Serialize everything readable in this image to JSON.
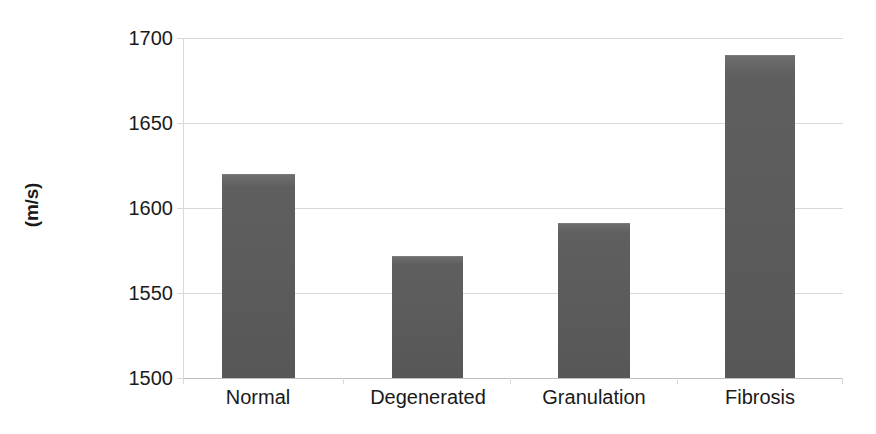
{
  "chart_data": {
    "type": "bar",
    "title": "",
    "subtitle": "",
    "xlabel": "",
    "ylabel": "(m/s)",
    "categories": [
      "Normal",
      "Degenerated",
      "Granulation",
      "Fibrosis"
    ],
    "values": [
      1620,
      1572,
      1591,
      1690
    ],
    "ylim": [
      1500,
      1700
    ],
    "ytick_labels": [
      "1700",
      "1650",
      "1600",
      "1550",
      "1500"
    ],
    "ytick_values": [
      1700,
      1650,
      1600,
      1550,
      1500
    ],
    "grid": true,
    "legend": null,
    "legend_position": "none",
    "series": [
      {
        "name": "Sound speed",
        "values": [
          1620,
          1572,
          1591,
          1690
        ],
        "color": "#5b5b5b"
      }
    ],
    "colors": {
      "bar_fill": "#5b5b5b",
      "gridline": "#d9d9d9",
      "axis_line": "#bfbfbf",
      "text": "#1a1a1a",
      "background": "#ffffff"
    }
  },
  "axis": {
    "y_title": "(m/s)",
    "ticks": [
      {
        "label": "1700",
        "value": 1700
      },
      {
        "label": "1650",
        "value": 1650
      },
      {
        "label": "1600",
        "value": 1600
      },
      {
        "label": "1550",
        "value": 1550
      },
      {
        "label": "1500",
        "value": 1500
      }
    ]
  },
  "bars": [
    {
      "label": "Normal",
      "value": 1620
    },
    {
      "label": "Degenerated",
      "value": 1572
    },
    {
      "label": "Granulation",
      "value": 1591
    },
    {
      "label": "Fibrosis",
      "value": 1690
    }
  ]
}
